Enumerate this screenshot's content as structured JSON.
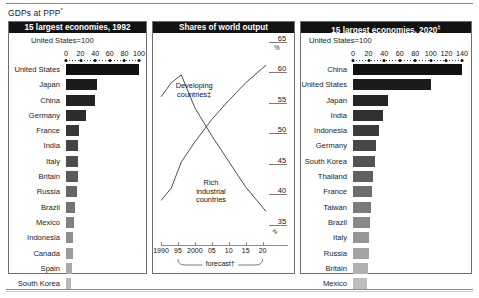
{
  "suptitle": "GDPs at PPP",
  "suptitle_mark": "*",
  "left_panel": {
    "title": "15 largest economies, 1992",
    "unit_note": "United States=100",
    "axis": {
      "min": 0,
      "max": 100,
      "ticks": [
        0,
        20,
        40,
        60,
        80,
        100
      ]
    },
    "rows": [
      {
        "label": "United States",
        "value": 100,
        "color": "#111111"
      },
      {
        "label": "Japan",
        "value": 42,
        "color": "#1b1b1b"
      },
      {
        "label": "China",
        "value": 40,
        "color": "#232323"
      },
      {
        "label": "Germany",
        "value": 27,
        "color": "#2d2d2d"
      },
      {
        "label": "France",
        "value": 18,
        "color": "#383838"
      },
      {
        "label": "India",
        "value": 17,
        "color": "#434343"
      },
      {
        "label": "Italy",
        "value": 17,
        "color": "#4e4e4e"
      },
      {
        "label": "Britain",
        "value": 16,
        "color": "#5a5a5a"
      },
      {
        "label": "Russia",
        "value": 15,
        "color": "#666666"
      },
      {
        "label": "Brazil",
        "value": 13,
        "color": "#737373"
      },
      {
        "label": "Mexico",
        "value": 11,
        "color": "#818181"
      },
      {
        "label": "Indonesia",
        "value": 10,
        "color": "#8e8e8e"
      },
      {
        "label": "Canada",
        "value": 9,
        "color": "#9b9b9b"
      },
      {
        "label": "Spain",
        "value": 8,
        "color": "#a9a9a9"
      },
      {
        "label": "South Korea",
        "value": 7,
        "color": "#b8b8b8"
      }
    ]
  },
  "mid_panel": {
    "title": "Shares of world output",
    "y_unit": "%",
    "y_break": "∿",
    "axis_y": {
      "min": 33,
      "max": 65,
      "ticks": [
        65,
        60,
        55,
        50,
        45,
        40,
        35
      ]
    },
    "axis_x": {
      "min": 1990,
      "max": 2021,
      "ticklabels": [
        "1990",
        "95",
        "2000",
        "05",
        "10",
        "15",
        "20"
      ],
      "tickvalues": [
        1990,
        1995,
        2000,
        2005,
        2010,
        2015,
        2020
      ]
    },
    "forecast_label": "forecast",
    "forecast_mark": "†",
    "forecast_range": [
      1995,
      2020
    ],
    "series": [
      {
        "name": "Developing countries",
        "name_mark": "‡",
        "label_x": 2002,
        "label_y": 57.4,
        "points": [
          {
            "x": 1990,
            "y": 39.0
          },
          {
            "x": 1993,
            "y": 41.0
          },
          {
            "x": 1996,
            "y": 45.3
          },
          {
            "x": 2000,
            "y": 48.6
          },
          {
            "x": 2005,
            "y": 52.3
          },
          {
            "x": 2010,
            "y": 55.4
          },
          {
            "x": 2015,
            "y": 58.3
          },
          {
            "x": 2021,
            "y": 61.2
          }
        ]
      },
      {
        "name": "Rich industrial countries",
        "label_x": 2008,
        "label_y": 41.5,
        "points": [
          {
            "x": 1990,
            "y": 56.0
          },
          {
            "x": 1993,
            "y": 58.3
          },
          {
            "x": 1996,
            "y": 59.6
          },
          {
            "x": 2000,
            "y": 54.2
          },
          {
            "x": 2005,
            "y": 49.6
          },
          {
            "x": 2010,
            "y": 45.4
          },
          {
            "x": 2015,
            "y": 41.2
          },
          {
            "x": 2021,
            "y": 37.2
          }
        ]
      }
    ]
  },
  "right_panel": {
    "title": "15 largest economies, 2020",
    "title_mark": "‡",
    "unit_note": "United States=100",
    "axis": {
      "min": 0,
      "max": 140,
      "ticks": [
        0,
        20,
        40,
        60,
        80,
        100,
        120,
        140
      ]
    },
    "rows": [
      {
        "label": "China",
        "value": 140,
        "color": "#111111"
      },
      {
        "label": "United States",
        "value": 100,
        "color": "#1b1b1b"
      },
      {
        "label": "Japan",
        "value": 45,
        "color": "#252525"
      },
      {
        "label": "India",
        "value": 38,
        "color": "#303030"
      },
      {
        "label": "Indonesia",
        "value": 34,
        "color": "#3b3b3b"
      },
      {
        "label": "Germany",
        "value": 30,
        "color": "#474747"
      },
      {
        "label": "South Korea",
        "value": 28,
        "color": "#535353"
      },
      {
        "label": "Thailand",
        "value": 26,
        "color": "#606060"
      },
      {
        "label": "France",
        "value": 24,
        "color": "#6d6d6d"
      },
      {
        "label": "Taiwan",
        "value": 23,
        "color": "#7a7a7a"
      },
      {
        "label": "Brazil",
        "value": 22,
        "color": "#888888"
      },
      {
        "label": "Italy",
        "value": 21,
        "color": "#959595"
      },
      {
        "label": "Russia",
        "value": 20,
        "color": "#a3a3a3"
      },
      {
        "label": "Britain",
        "value": 19,
        "color": "#b0b0b0"
      },
      {
        "label": "Mexico",
        "value": 18,
        "color": "#bdbdbd"
      }
    ]
  },
  "chart_data": [
    {
      "type": "bar",
      "title": "15 largest economies, 1992",
      "subtitle": "United States=100",
      "orientation": "horizontal",
      "xlabel": "",
      "ylabel": "",
      "xlim": [
        0,
        100
      ],
      "categories": [
        "United States",
        "Japan",
        "China",
        "Germany",
        "France",
        "India",
        "Italy",
        "Britain",
        "Russia",
        "Brazil",
        "Mexico",
        "Indonesia",
        "Canada",
        "Spain",
        "South Korea"
      ],
      "values": [
        100,
        42,
        40,
        27,
        18,
        17,
        17,
        16,
        15,
        13,
        11,
        10,
        9,
        8,
        7
      ],
      "grid": false,
      "legend": "none"
    },
    {
      "type": "line",
      "title": "Shares of world output",
      "xlabel": "",
      "ylabel": "%",
      "ylim": [
        33,
        65
      ],
      "xlim": [
        1990,
        2021
      ],
      "yticks": [
        35,
        40,
        45,
        50,
        55,
        60,
        65
      ],
      "xticks": [
        1990,
        1995,
        2000,
        2005,
        2010,
        2015,
        2020
      ],
      "xticklabels": [
        "1990",
        "95",
        "2000",
        "05",
        "10",
        "15",
        "20"
      ],
      "annotations": [
        "Developing countries‡",
        "Rich industrial countries",
        "forecast†"
      ],
      "grid": false,
      "legend": "inline-annotation",
      "series": [
        {
          "name": "Developing countries",
          "x": [
            1990,
            1993,
            1996,
            2000,
            2005,
            2010,
            2015,
            2021
          ],
          "values": [
            39.0,
            41.0,
            45.3,
            48.6,
            52.3,
            55.4,
            58.3,
            61.2
          ]
        },
        {
          "name": "Rich industrial countries",
          "x": [
            1990,
            1993,
            1996,
            2000,
            2005,
            2010,
            2015,
            2021
          ],
          "values": [
            56.0,
            58.3,
            59.6,
            54.2,
            49.6,
            45.4,
            41.2,
            37.2
          ]
        }
      ]
    },
    {
      "type": "bar",
      "title": "15 largest economies, 2020‡",
      "subtitle": "United States=100",
      "orientation": "horizontal",
      "xlabel": "",
      "ylabel": "",
      "xlim": [
        0,
        140
      ],
      "categories": [
        "China",
        "United States",
        "Japan",
        "India",
        "Indonesia",
        "Germany",
        "South Korea",
        "Thailand",
        "France",
        "Taiwan",
        "Brazil",
        "Italy",
        "Russia",
        "Britain",
        "Mexico"
      ],
      "values": [
        140,
        100,
        45,
        38,
        34,
        30,
        28,
        26,
        24,
        23,
        22,
        21,
        20,
        19,
        18
      ],
      "grid": false,
      "legend": "none"
    }
  ]
}
